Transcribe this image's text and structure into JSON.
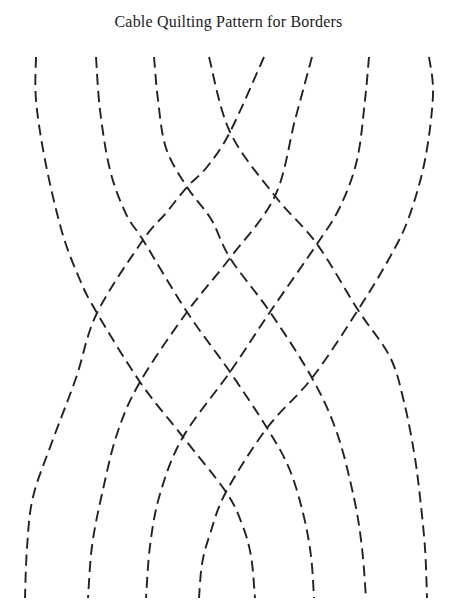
{
  "page": {
    "title": "Cable Quilting Pattern for Borders",
    "background_color": "#ffffff",
    "title_color": "#1a1a1a"
  },
  "pattern": {
    "description": "Cable quilting border pattern: eight dashed strands crossing in a braid lattice of diamonds",
    "canvas": {
      "width": 457,
      "height": 604
    },
    "stroke_color": "#222222",
    "stroke_width": 1.9,
    "dash_length": 11,
    "gap_length": 6,
    "strands": [
      {
        "name": "strand-1",
        "points": [
          [
            36,
            57
          ],
          [
            36,
            100
          ],
          [
            45,
            160
          ],
          [
            62,
            232
          ],
          [
            80,
            280
          ],
          [
            97,
            313
          ],
          [
            140,
            382
          ],
          [
            183,
            437
          ],
          [
            226,
            492
          ],
          [
            242,
            524
          ],
          [
            251,
            556
          ],
          [
            255,
            598
          ]
        ]
      },
      {
        "name": "strand-2",
        "points": [
          [
            96,
            57
          ],
          [
            100,
            110
          ],
          [
            110,
            170
          ],
          [
            126,
            214
          ],
          [
            143,
            240
          ],
          [
            187,
            312
          ],
          [
            230,
            372
          ],
          [
            267,
            428
          ],
          [
            289,
            468
          ],
          [
            303,
            513
          ],
          [
            311,
            556
          ],
          [
            314,
            598
          ]
        ]
      },
      {
        "name": "strand-3",
        "points": [
          [
            154,
            57
          ],
          [
            158,
            100
          ],
          [
            166,
            148
          ],
          [
            187,
            187
          ],
          [
            211,
            219
          ],
          [
            230,
            258
          ],
          [
            270,
            312
          ],
          [
            312,
            378
          ],
          [
            337,
            433
          ],
          [
            354,
            498
          ],
          [
            362,
            548
          ],
          [
            366,
            598
          ]
        ]
      },
      {
        "name": "strand-4",
        "points": [
          [
            209,
            57
          ],
          [
            230,
            132
          ],
          [
            275,
            196
          ],
          [
            317,
            244
          ],
          [
            358,
            310
          ],
          [
            390,
            357
          ],
          [
            404,
            402
          ],
          [
            414,
            452
          ],
          [
            420,
            497
          ],
          [
            425,
            548
          ],
          [
            427,
            598
          ]
        ]
      },
      {
        "name": "strand-5",
        "points": [
          [
            264,
            57
          ],
          [
            230,
            132
          ],
          [
            207,
            167
          ],
          [
            187,
            187
          ],
          [
            166,
            213
          ],
          [
            143,
            240
          ],
          [
            97,
            313
          ],
          [
            76,
            378
          ],
          [
            52,
            442
          ],
          [
            33,
            497
          ],
          [
            27,
            548
          ],
          [
            25,
            598
          ]
        ]
      },
      {
        "name": "strand-6",
        "points": [
          [
            312,
            57
          ],
          [
            295,
            120
          ],
          [
            275,
            196
          ],
          [
            230,
            258
          ],
          [
            187,
            312
          ],
          [
            140,
            382
          ],
          [
            117,
            434
          ],
          [
            102,
            494
          ],
          [
            92,
            546
          ],
          [
            88,
            598
          ]
        ]
      },
      {
        "name": "strand-7",
        "points": [
          [
            369,
            57
          ],
          [
            365,
            100
          ],
          [
            357,
            160
          ],
          [
            340,
            207
          ],
          [
            317,
            244
          ],
          [
            270,
            312
          ],
          [
            230,
            372
          ],
          [
            183,
            437
          ],
          [
            160,
            494
          ],
          [
            150,
            546
          ],
          [
            146,
            598
          ]
        ]
      },
      {
        "name": "strand-8",
        "points": [
          [
            429,
            57
          ],
          [
            433,
            95
          ],
          [
            425,
            160
          ],
          [
            409,
            217
          ],
          [
            390,
            257
          ],
          [
            358,
            310
          ],
          [
            312,
            378
          ],
          [
            267,
            428
          ],
          [
            226,
            492
          ],
          [
            210,
            534
          ],
          [
            202,
            564
          ],
          [
            199,
            598
          ]
        ]
      }
    ]
  }
}
